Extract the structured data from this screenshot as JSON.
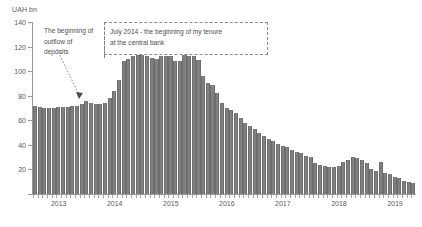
{
  "chart_data": {
    "type": "bar",
    "title": "",
    "subtitle": "",
    "ylabel": "UAH bn",
    "xlabel": "",
    "ylim": [
      0,
      140
    ],
    "yticks": [
      0,
      20,
      40,
      60,
      80,
      100,
      120,
      140
    ],
    "ytick_labels": [
      "",
      "20",
      "40",
      "60",
      "80",
      "100",
      "120",
      "140"
    ],
    "grid": false,
    "legend": null,
    "xtick_labels": [
      "2013",
      "2014",
      "2015",
      "2016",
      "2017",
      "2018",
      "2019"
    ],
    "xtick_positions": [
      0.5,
      12.5,
      24.5,
      36.5,
      48.5,
      60.5,
      72.5
    ],
    "bar_color": "#808080",
    "categories": [
      "2013-01",
      "2013-02",
      "2013-03",
      "2013-04",
      "2013-05",
      "2013-06",
      "2013-07",
      "2013-08",
      "2013-09",
      "2013-10",
      "2013-11",
      "2013-12",
      "2014-01",
      "2014-02",
      "2014-03",
      "2014-04",
      "2014-05",
      "2014-06",
      "2014-07",
      "2014-08",
      "2014-09",
      "2014-10",
      "2014-11",
      "2014-12",
      "2015-01",
      "2015-02",
      "2015-03",
      "2015-04",
      "2015-05",
      "2015-06",
      "2015-07",
      "2015-08",
      "2015-09",
      "2015-10",
      "2015-11",
      "2015-12",
      "2016-01",
      "2016-02",
      "2016-03",
      "2016-04",
      "2016-05",
      "2016-06",
      "2016-07",
      "2016-08",
      "2016-09",
      "2016-10",
      "2016-11",
      "2016-12",
      "2017-01",
      "2017-02",
      "2017-03",
      "2017-04",
      "2017-05",
      "2017-06",
      "2017-07",
      "2017-08",
      "2017-09",
      "2017-10",
      "2017-11",
      "2017-12",
      "2018-01",
      "2018-02",
      "2018-03",
      "2018-04",
      "2018-05",
      "2018-06",
      "2018-07",
      "2018-08",
      "2018-09",
      "2018-10",
      "2018-11",
      "2018-12",
      "2019-01",
      "2019-02",
      "2019-03",
      "2019-04",
      "2019-05",
      "2019-06",
      "2019-07",
      "2019-08",
      "2019-09",
      "2019-10"
    ],
    "values": [
      72,
      71,
      70,
      70,
      70,
      71,
      71,
      71,
      72,
      72,
      73,
      76,
      74,
      73,
      73,
      74,
      78,
      84,
      93,
      108,
      110,
      112,
      113,
      113,
      112,
      111,
      110,
      112,
      112,
      112,
      108,
      108,
      113,
      112,
      112,
      109,
      96,
      90,
      89,
      82,
      74,
      70,
      68,
      66,
      62,
      58,
      55,
      53,
      50,
      47,
      45,
      43,
      41,
      39,
      38,
      36,
      34,
      33,
      31,
      30,
      25,
      24,
      23,
      22,
      22,
      23,
      26,
      28,
      30,
      29,
      28,
      25,
      20,
      19,
      26,
      17,
      16,
      14,
      13,
      11,
      10,
      9
    ]
  },
  "annotations": {
    "left": {
      "line1": "The beginning of",
      "line2": "outflow of",
      "line3": "deposits"
    },
    "right": {
      "line1": "July 2014 - the beginning of my tenure",
      "line2": "at the central bank"
    }
  }
}
